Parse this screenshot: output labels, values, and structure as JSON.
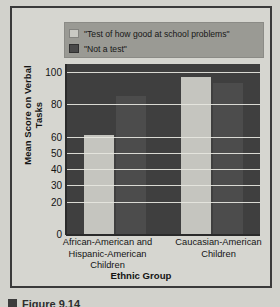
{
  "figure": {
    "caption_marker": "figure-square-marker",
    "caption_text": "Figure 9.14"
  },
  "legend": {
    "position": "top-inside",
    "entries": [
      {
        "label": "\"Test of how good at school problems\"",
        "color": "#c5c5bf",
        "swatch_name": "legend-swatch-light"
      },
      {
        "label": "\"Not a test\"",
        "color": "#4c4c4c",
        "swatch_name": "legend-swatch-dark"
      }
    ]
  },
  "axes": {
    "ylabel": "Mean Score on Verbal Tasks",
    "xlabel": "Ethnic Group"
  },
  "chart_data": {
    "type": "bar",
    "title": "",
    "subtitle": "",
    "xlabel": "Ethnic Group",
    "ylabel": "Mean Score on Verbal Tasks",
    "ylim": [
      0,
      105
    ],
    "yticks": [
      0,
      20,
      30,
      40,
      50,
      60,
      80,
      100
    ],
    "ytick_labels": [
      "0",
      "20",
      "30",
      "40",
      "50",
      "60",
      "80",
      "100"
    ],
    "grid": true,
    "grid_axis": "y",
    "legend_position": "top",
    "categories": [
      "African-American and Hispanic-American Children",
      "Caucasian-American Children"
    ],
    "category_lines": [
      [
        "African-American and",
        "Hispanic-American",
        "Children"
      ],
      [
        "Caucasian-American",
        "Children"
      ]
    ],
    "series": [
      {
        "name": "\"Test of how good at school problems\"",
        "color": "#c5c5bf",
        "values": [
          61,
          97
        ]
      },
      {
        "name": "\"Not a test\"",
        "color": "#4c4c4c",
        "values": [
          85,
          93
        ]
      }
    ],
    "annotations": []
  },
  "colors": {
    "plot_background": "#3f3f3f",
    "figure_background": "#d2d2cc",
    "legend_background": "#9a9a94",
    "gridline": "#e6e6e0",
    "frame_border": "#3a3a3a",
    "text": "#141414"
  }
}
